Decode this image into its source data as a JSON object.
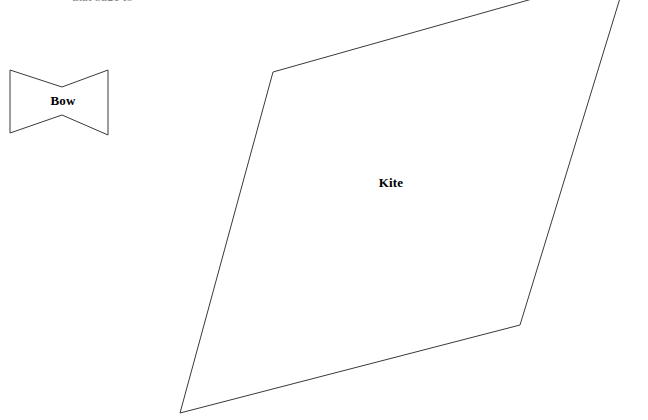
{
  "canvas": {
    "width": 648,
    "height": 420,
    "background_color": "#ffffff",
    "stroke_color": "#3a3a3a",
    "stroke_width": 1,
    "label_color": "#000000"
  },
  "header": {
    "clipped_text": "that page to"
  },
  "figures": [
    {
      "id": "bow",
      "label": "Bow",
      "shape_type": "concave-hexagon-bowtie",
      "label_x": 63,
      "label_y": 101,
      "points": "10,70 62,87 108,70 108,135 62,115 10,133",
      "vertices": [
        {
          "x": 10,
          "y": 70
        },
        {
          "x": 62,
          "y": 87
        },
        {
          "x": 108,
          "y": 70
        },
        {
          "x": 108,
          "y": 135
        },
        {
          "x": 62,
          "y": 115
        },
        {
          "x": 10,
          "y": 133
        }
      ]
    },
    {
      "id": "kite",
      "label": "Kite",
      "shape_type": "quadrilateral",
      "label_x": 391,
      "label_y": 183,
      "points": "273,72 628,-28 520,325 180,413",
      "vertices": [
        {
          "x": 273,
          "y": 72
        },
        {
          "x": 628,
          "y": -28
        },
        {
          "x": 520,
          "y": 325
        },
        {
          "x": 180,
          "y": 413
        }
      ],
      "note": "top vertex clipped above canvas"
    }
  ]
}
